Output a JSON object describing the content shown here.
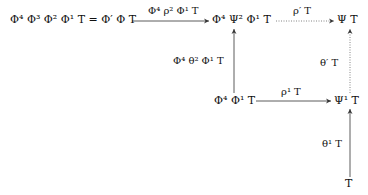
{
  "diagram": {
    "type": "commutative-diagram",
    "nodes": {
      "top_left": "Φ⁴ Φ³ Φ² Φ¹ T = Φ′ Φ T",
      "top_middle": "Φ⁴ Ψ² Φ¹ T",
      "top_right": "Ψ T",
      "mid_middle": "Φ⁴ Φ¹ T",
      "mid_right": "Ψ¹ T",
      "bottom_right": "T"
    },
    "edges": {
      "top_left_to_top_middle": {
        "label": "Φ⁴ ρ² Φ¹ T",
        "style": "solid"
      },
      "top_middle_to_top_right": {
        "label": "ρ′ T",
        "style": "dotted"
      },
      "mid_middle_to_top_middle": {
        "label": "Φ⁴ θ² Φ¹ T",
        "style": "solid"
      },
      "mid_right_to_top_right": {
        "label": "θ′ T",
        "style": "dotted"
      },
      "mid_middle_to_mid_right": {
        "label": "ρ¹ T",
        "style": "solid"
      },
      "bottom_right_to_mid_right": {
        "label": "θ¹ T",
        "style": "solid"
      }
    }
  }
}
